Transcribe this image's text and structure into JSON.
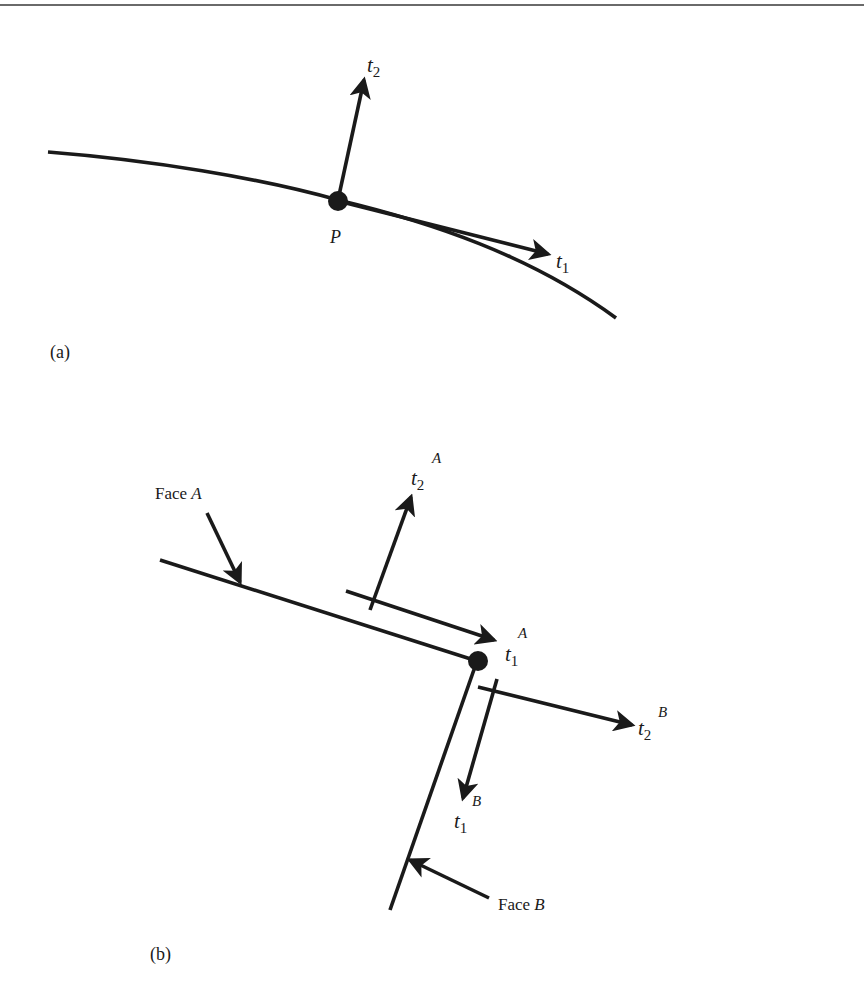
{
  "figure": {
    "top_rule": true,
    "panel_a": {
      "caption": "(a)",
      "point_label": "P",
      "vectors": [
        {
          "id": "t1",
          "base": "t",
          "sub": "1",
          "sup": ""
        },
        {
          "id": "t2",
          "base": "t",
          "sub": "2",
          "sup": ""
        }
      ]
    },
    "panel_b": {
      "caption": "(b)",
      "faces": [
        {
          "id": "A",
          "prefix": "Face ",
          "letter": "A"
        },
        {
          "id": "B",
          "prefix": "Face ",
          "letter": "B"
        }
      ],
      "vectors": [
        {
          "id": "t1A",
          "base": "t",
          "sub": "1",
          "sup": "A"
        },
        {
          "id": "t2A",
          "base": "t",
          "sub": "2",
          "sup": "A"
        },
        {
          "id": "t1B",
          "base": "t",
          "sub": "1",
          "sup": "B"
        },
        {
          "id": "t2B",
          "base": "t",
          "sub": "2",
          "sup": "B"
        }
      ]
    },
    "colors": {
      "ink": "#1a1a1a",
      "rule": "#6a6a6a",
      "background": "#ffffff"
    }
  }
}
